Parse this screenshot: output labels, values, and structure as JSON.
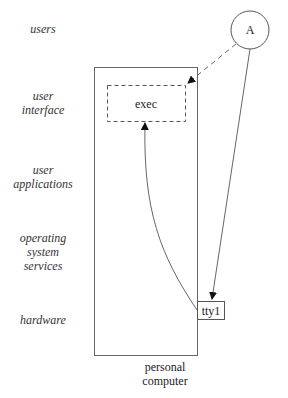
{
  "layers": [
    {
      "id": "users",
      "label": "users"
    },
    {
      "id": "user-interface",
      "label": "user\ninterface"
    },
    {
      "id": "user-applications",
      "label": "user\napplications"
    },
    {
      "id": "operating-system-services",
      "label": "operating\nsystem\nservices"
    },
    {
      "id": "hardware",
      "label": "hardware"
    }
  ],
  "nodes": {
    "actor": {
      "label": "A",
      "shape": "circle"
    },
    "exec": {
      "label": "exec",
      "shape": "dashed-rectangle"
    },
    "tty": {
      "label": "tty1",
      "shape": "rectangle"
    },
    "container": {
      "label": "personal\ncomputer",
      "shape": "rectangle"
    }
  },
  "edges": [
    {
      "from": "actor",
      "to": "exec",
      "style": "dashed"
    },
    {
      "from": "actor",
      "to": "tty",
      "style": "solid"
    },
    {
      "from": "tty",
      "to": "exec",
      "style": "solid-curved"
    }
  ],
  "colors": {
    "stroke": "#555555",
    "text": "#222222",
    "label": "#333333",
    "background": "#ffffff"
  }
}
